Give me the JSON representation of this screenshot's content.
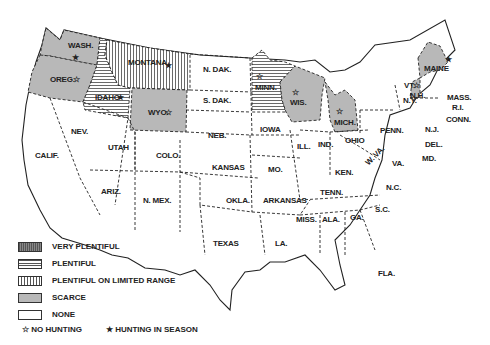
{
  "map": {
    "title": "",
    "legend": {
      "categories": [
        {
          "key": "very_plentiful",
          "label": "VERY PLENTIFUL"
        },
        {
          "key": "plentiful",
          "label": "PLENTIFUL"
        },
        {
          "key": "plentiful_limited",
          "label": "PLENTIFUL ON LIMITED RANGE"
        },
        {
          "key": "scarce",
          "label": "SCARCE"
        },
        {
          "key": "none",
          "label": "NONE"
        }
      ],
      "symbols": [
        {
          "icon": "☆",
          "label": "NO HUNTING"
        },
        {
          "icon": "★",
          "label": "HUNTING IN SEASON"
        }
      ]
    },
    "states": [
      {
        "abbr": "WASH.",
        "status": "scarce",
        "symbol": "★"
      },
      {
        "abbr": "OREG.",
        "status": "scarce",
        "symbol": "☆"
      },
      {
        "abbr": "IDAHO",
        "status": "plentiful",
        "symbol": "★"
      },
      {
        "abbr": "MONTANA",
        "status": "plentiful_limited",
        "symbol": "★"
      },
      {
        "abbr": "WYO.",
        "status": "scarce",
        "symbol": "☆"
      },
      {
        "abbr": "N. DAK.",
        "status": "none",
        "symbol": ""
      },
      {
        "abbr": "S. DAK.",
        "status": "none",
        "symbol": ""
      },
      {
        "abbr": "MINN.",
        "status": "plentiful",
        "symbol": "☆"
      },
      {
        "abbr": "WIS.",
        "status": "scarce",
        "symbol": "☆"
      },
      {
        "abbr": "MICH.",
        "status": "scarce",
        "symbol": "☆"
      },
      {
        "abbr": "MAINE",
        "status": "scarce",
        "symbol": "★"
      },
      {
        "abbr": "VT.",
        "status": "none",
        "symbol": "☆"
      },
      {
        "abbr": "N.H.",
        "status": "scarce",
        "symbol": ""
      },
      {
        "abbr": "N.Y.",
        "status": "none",
        "symbol": ""
      },
      {
        "abbr": "MASS.",
        "status": "none",
        "symbol": ""
      },
      {
        "abbr": "R.I.",
        "status": "none",
        "symbol": ""
      },
      {
        "abbr": "CONN.",
        "status": "none",
        "symbol": ""
      },
      {
        "abbr": "N.J.",
        "status": "none",
        "symbol": ""
      },
      {
        "abbr": "DEL.",
        "status": "none",
        "symbol": ""
      },
      {
        "abbr": "MD.",
        "status": "none",
        "symbol": ""
      },
      {
        "abbr": "PENN.",
        "status": "none",
        "symbol": ""
      },
      {
        "abbr": "OHIO",
        "status": "none",
        "symbol": ""
      },
      {
        "abbr": "W. VA.",
        "status": "none",
        "symbol": ""
      },
      {
        "abbr": "VA.",
        "status": "none",
        "symbol": ""
      },
      {
        "abbr": "N.C.",
        "status": "none",
        "symbol": ""
      },
      {
        "abbr": "S.C.",
        "status": "none",
        "symbol": ""
      },
      {
        "abbr": "GA.",
        "status": "none",
        "symbol": ""
      },
      {
        "abbr": "FLA.",
        "status": "none",
        "symbol": ""
      },
      {
        "abbr": "ALA.",
        "status": "none",
        "symbol": ""
      },
      {
        "abbr": "MISS.",
        "status": "none",
        "symbol": ""
      },
      {
        "abbr": "TENN.",
        "status": "none",
        "symbol": ""
      },
      {
        "abbr": "KEN.",
        "status": "none",
        "symbol": ""
      },
      {
        "abbr": "IND.",
        "status": "none",
        "symbol": ""
      },
      {
        "abbr": "ILL.",
        "status": "none",
        "symbol": ""
      },
      {
        "abbr": "IOWA",
        "status": "none",
        "symbol": ""
      },
      {
        "abbr": "MO.",
        "status": "none",
        "symbol": ""
      },
      {
        "abbr": "ARKANSAS",
        "status": "none",
        "symbol": ""
      },
      {
        "abbr": "LA.",
        "status": "none",
        "symbol": ""
      },
      {
        "abbr": "TEXAS",
        "status": "none",
        "symbol": ""
      },
      {
        "abbr": "OKLA.",
        "status": "none",
        "symbol": ""
      },
      {
        "abbr": "KANSAS",
        "status": "none",
        "symbol": ""
      },
      {
        "abbr": "NEB.",
        "status": "none",
        "symbol": ""
      },
      {
        "abbr": "COLO.",
        "status": "none",
        "symbol": ""
      },
      {
        "abbr": "N. MEX.",
        "status": "none",
        "symbol": ""
      },
      {
        "abbr": "ARIZ.",
        "status": "none",
        "symbol": ""
      },
      {
        "abbr": "UTAH",
        "status": "none",
        "symbol": ""
      },
      {
        "abbr": "NEV.",
        "status": "none",
        "symbol": ""
      },
      {
        "abbr": "CALIF.",
        "status": "none",
        "symbol": ""
      }
    ],
    "colors": {
      "scarce": "#b8b8b8",
      "line": "#222222",
      "background": "#ffffff"
    }
  }
}
